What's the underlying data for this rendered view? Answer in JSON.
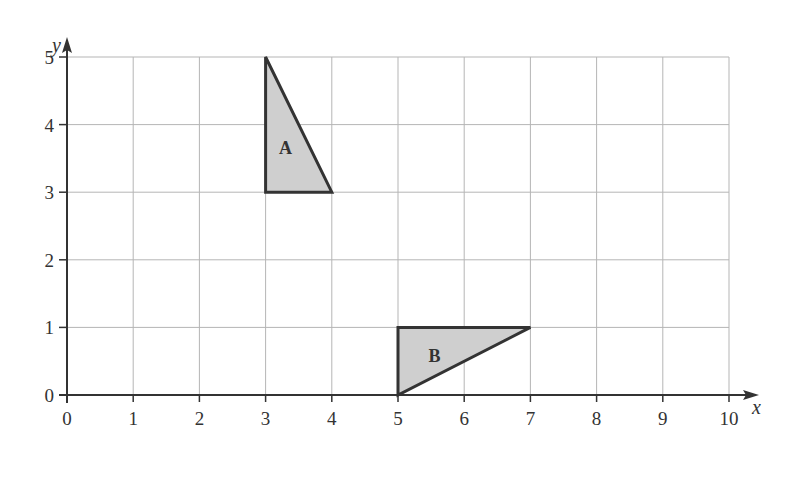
{
  "figure": {
    "axes": {
      "x_label": "x",
      "y_label": "y",
      "x_ticks": [
        "0",
        "1",
        "2",
        "3",
        "4",
        "5",
        "6",
        "7",
        "8",
        "9",
        "10"
      ],
      "y_ticks": [
        "0",
        "1",
        "2",
        "3",
        "4",
        "5"
      ],
      "x_range": [
        0,
        10
      ],
      "y_range": [
        0,
        5
      ],
      "grid": true
    },
    "shapes": [
      {
        "label": "A",
        "vertices": [
          [
            3,
            5
          ],
          [
            3,
            3
          ],
          [
            4,
            3
          ]
        ],
        "fill": "#cfcfcf",
        "stroke": "#333333"
      },
      {
        "label": "B",
        "vertices": [
          [
            5,
            1
          ],
          [
            5,
            0
          ],
          [
            7,
            1
          ]
        ],
        "fill": "#cfcfcf",
        "stroke": "#333333"
      }
    ],
    "colors": {
      "grid": "#b5b5b5",
      "axis": "#333333",
      "text": "#333333"
    }
  }
}
